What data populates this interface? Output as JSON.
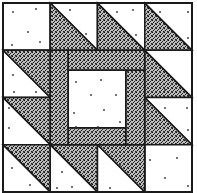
{
  "diagram": {
    "type": "quilt-block",
    "grid": {
      "rows": 4,
      "cols": 4
    },
    "colors": {
      "dark_fill": "#3a3a3a",
      "light_fill": "#ffffff",
      "outline": "#1a1a1a"
    },
    "cells": [
      {
        "row": 0,
        "col": 0,
        "kind": "plain"
      },
      {
        "row": 0,
        "col": 1,
        "kind": "hst",
        "dark": "lower-left"
      },
      {
        "row": 0,
        "col": 2,
        "kind": "hst",
        "dark": "lower-left"
      },
      {
        "row": 0,
        "col": 3,
        "kind": "hst",
        "dark": "lower-left"
      },
      {
        "row": 1,
        "col": 0,
        "kind": "hst",
        "dark": "upper-right"
      },
      {
        "row": 2,
        "col": 0,
        "kind": "hst",
        "dark": "upper-right"
      },
      {
        "row": 3,
        "col": 0,
        "kind": "hst",
        "dark": "upper-right"
      },
      {
        "row": 1,
        "col": 3,
        "kind": "hst",
        "dark": "lower-left"
      },
      {
        "row": 2,
        "col": 3,
        "kind": "hst",
        "dark": "lower-left"
      },
      {
        "row": 3,
        "col": 3,
        "kind": "plain"
      },
      {
        "row": 3,
        "col": 1,
        "kind": "hst",
        "dark": "upper-right"
      },
      {
        "row": 3,
        "col": 2,
        "kind": "hst",
        "dark": "upper-right"
      }
    ],
    "center": {
      "kind": "framed-square",
      "frame": "dark",
      "inner": "light"
    }
  }
}
